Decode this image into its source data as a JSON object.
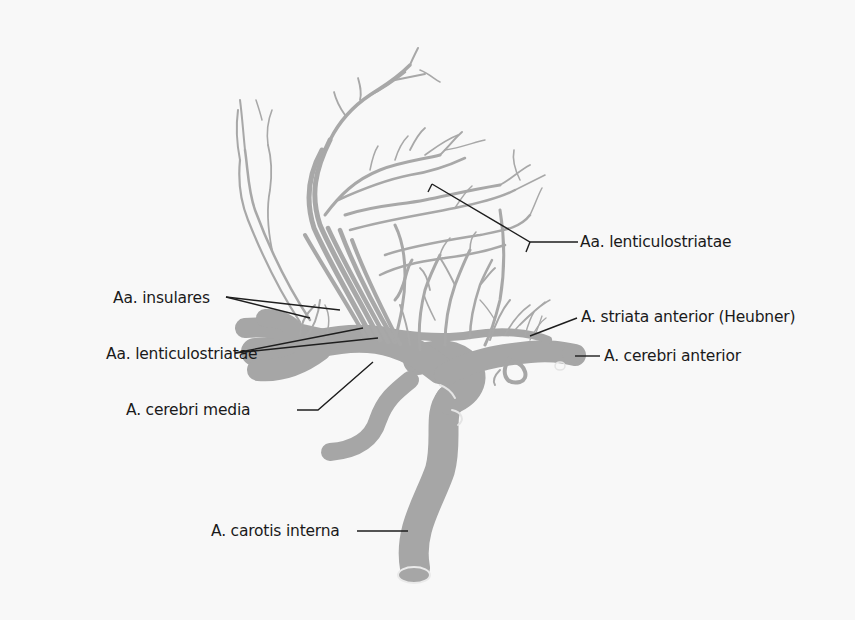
{
  "figure": {
    "vessel_color": "#a6a6a6",
    "background_color": "#f8f8f8",
    "leader_line_color": "#1e1e1e"
  },
  "labels": {
    "lenticulostriatae_upper": "Aa. lenticulostriatae",
    "insulares": "Aa. insulares",
    "lenticulostriatae_lower": "Aa. lenticulostriatae",
    "cerebri_media": "A. cerebri media",
    "striata_anterior": "A. striata anterior (Heubner)",
    "cerebri_anterior": "A. cerebri anterior",
    "carotis_interna": "A. carotis interna"
  }
}
